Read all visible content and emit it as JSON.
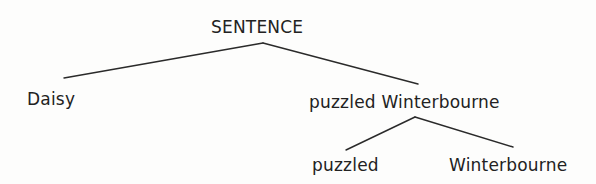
{
  "diagram": {
    "type": "syntax-tree",
    "nodes": {
      "root": {
        "label": "SENTENCE"
      },
      "left_child": {
        "label": "Daisy"
      },
      "right_child": {
        "label": "puzzled Winterbourne"
      },
      "right_left_child": {
        "label": "puzzled"
      },
      "right_right_child": {
        "label": "Winterbourne"
      }
    },
    "edges": [
      {
        "from": "root",
        "to": "left_child"
      },
      {
        "from": "root",
        "to": "right_child"
      },
      {
        "from": "right_child",
        "to": "right_left_child"
      },
      {
        "from": "right_child",
        "to": "right_right_child"
      }
    ]
  }
}
